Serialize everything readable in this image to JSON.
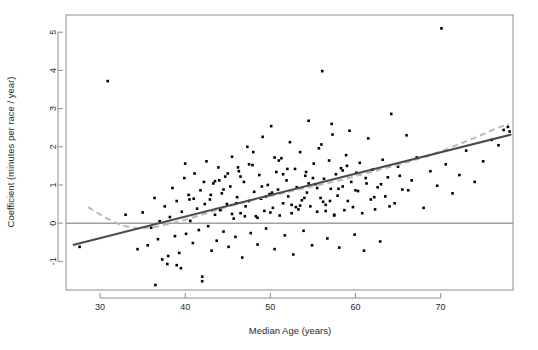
{
  "chart_data": {
    "type": "scatter",
    "title": "",
    "xlabel": "Median Age (years)",
    "ylabel": "Coefficient (minutes per race / year)",
    "xlim": [
      26.0,
      78.5
    ],
    "ylim": [
      -1.75,
      5.45
    ],
    "xticks": [
      30,
      40,
      50,
      60,
      70
    ],
    "xtick_labels": [
      "30",
      "40",
      "50",
      "60",
      "70"
    ],
    "yticks": [
      -1,
      0,
      1,
      2,
      3,
      4,
      5
    ],
    "ytick_labels": [
      "-1",
      "0",
      "1",
      "2",
      "3",
      "4",
      "5"
    ],
    "grid": false,
    "legend": "none",
    "point_color": "#000000",
    "point_marker": "filled-square",
    "point_size": 2.6,
    "series": [
      {
        "name": "races",
        "x": [
          27.6,
          30.9,
          33.0,
          34.4,
          35.0,
          35.6,
          36.0,
          36.4,
          36.8,
          37.0,
          37.3,
          37.6,
          37.9,
          38.2,
          38.5,
          38.8,
          39.0,
          39.3,
          39.6,
          39.9,
          40.1,
          40.4,
          40.6,
          40.9,
          41.1,
          41.4,
          41.6,
          41.8,
          42.0,
          42.3,
          42.5,
          42.7,
          42.9,
          43.1,
          43.3,
          43.5,
          43.7,
          43.9,
          44.1,
          44.3,
          44.5,
          44.7,
          44.9,
          45.1,
          45.3,
          45.5,
          45.7,
          45.9,
          46.1,
          46.3,
          46.5,
          46.7,
          46.9,
          47.1,
          47.3,
          47.5,
          47.7,
          47.9,
          48.1,
          48.3,
          48.5,
          48.7,
          48.9,
          49.1,
          49.3,
          49.5,
          49.7,
          49.9,
          50.1,
          50.3,
          50.5,
          50.7,
          50.9,
          51.1,
          51.3,
          51.5,
          51.7,
          51.9,
          52.1,
          52.3,
          52.5,
          52.7,
          52.9,
          53.1,
          53.3,
          53.5,
          53.7,
          53.9,
          54.1,
          54.3,
          54.5,
          54.7,
          54.9,
          55.1,
          55.3,
          55.5,
          55.7,
          55.9,
          56.1,
          56.3,
          56.5,
          56.7,
          56.9,
          57.1,
          57.3,
          57.5,
          57.7,
          57.9,
          58.1,
          58.3,
          58.5,
          58.7,
          58.9,
          59.1,
          59.3,
          59.5,
          59.7,
          59.9,
          60.1,
          60.3,
          60.5,
          60.8,
          61.0,
          61.3,
          61.5,
          61.8,
          62.0,
          62.3,
          62.6,
          62.9,
          63.2,
          63.5,
          63.8,
          64.2,
          64.6,
          65.0,
          65.5,
          66.0,
          66.6,
          67.2,
          68.0,
          68.8,
          69.6,
          70.1,
          70.6,
          71.4,
          72.2,
          73.0,
          74.0,
          75.0,
          76.0,
          76.8,
          77.4,
          77.9,
          78.1,
          44.0,
          46.0,
          48.0,
          50.0,
          52.0,
          54.0,
          56.0,
          58.0,
          43.0,
          45.0,
          47.0,
          49.0,
          51.0,
          53.0,
          55.0,
          57.0,
          59.0,
          41.0,
          42.0,
          44.5,
          46.5,
          48.5,
          50.5,
          52.5,
          54.5,
          56.5,
          58.5,
          60.0,
          39.5,
          40.5,
          43.5,
          45.5,
          47.5,
          49.5,
          51.5,
          53.5,
          55.5,
          57.5,
          36.5,
          38.0,
          42.2,
          44.2,
          46.2,
          50.2,
          54.2,
          56.2,
          57.2,
          61.2,
          62.2,
          63.0,
          64.0,
          65.2,
          66.2,
          39.0,
          40.0
        ],
        "y": [
          -0.62,
          3.72,
          0.22,
          -0.68,
          0.28,
          -0.58,
          -0.12,
          0.66,
          -0.42,
          0.05,
          -0.95,
          0.44,
          -1.07,
          0.16,
          0.92,
          -0.34,
          0.58,
          -0.78,
          0.3,
          1.18,
          -0.28,
          0.74,
          0.06,
          -0.52,
          1.3,
          0.38,
          -0.18,
          0.86,
          -1.4,
          0.5,
          1.62,
          -0.08,
          0.62,
          -0.72,
          1.04,
          0.22,
          -0.46,
          1.46,
          0.34,
          0.78,
          -0.22,
          1.22,
          0.5,
          -0.62,
          0.96,
          1.74,
          0.12,
          -0.36,
          0.68,
          1.36,
          0.26,
          -0.9,
          1.08,
          0.44,
          2.0,
          0.58,
          -0.26,
          1.52,
          0.82,
          0.18,
          -0.56,
          1.26,
          0.64,
          2.26,
          0.32,
          -0.14,
          1.0,
          0.76,
          2.54,
          0.4,
          -0.68,
          1.34,
          0.88,
          0.2,
          1.7,
          0.52,
          -0.32,
          1.12,
          0.7,
          2.12,
          0.26,
          -0.82,
          1.42,
          0.94,
          0.36,
          1.86,
          0.6,
          -0.2,
          1.24,
          0.8,
          2.68,
          0.44,
          -0.58,
          1.56,
          1.02,
          0.3,
          1.96,
          0.66,
          3.98,
          1.16,
          0.48,
          -0.4,
          1.64,
          0.9,
          2.32,
          0.22,
          1.28,
          0.72,
          -0.64,
          1.44,
          0.96,
          0.34,
          1.78,
          0.58,
          2.42,
          1.08,
          0.42,
          -0.3,
          1.32,
          0.84,
          1.58,
          0.26,
          -0.72,
          1.04,
          2.22,
          0.62,
          1.4,
          0.36,
          0.94,
          -0.48,
          1.66,
          0.7,
          1.2,
          2.86,
          0.52,
          1.48,
          0.88,
          2.3,
          1.12,
          1.72,
          0.4,
          1.36,
          0.98,
          5.1,
          1.54,
          0.78,
          1.26,
          1.9,
          1.08,
          1.62,
          2.18,
          2.04,
          2.44,
          2.52,
          2.4,
          1.12,
          0.52,
          1.86,
          0.28,
          1.42,
          0.66,
          2.06,
          0.9,
          0.74,
          1.3,
          0.18,
          0.96,
          1.64,
          0.42,
          1.18,
          0.58,
          1.5,
          0.64,
          -1.52,
          0.88,
          1.22,
          0.14,
          1.72,
          0.48,
          1.04,
          0.32,
          1.38,
          0.86,
          -1.18,
          0.62,
          1.1,
          0.24,
          1.54,
          0.7,
          1.28,
          0.46,
          0.92,
          0.2,
          -1.62,
          -0.86,
          1.08,
          0.36,
          1.46,
          0.8,
          1.34,
          0.56,
          2.6,
          1.18,
          0.68,
          1.02,
          0.44,
          1.24,
          0.86,
          -1.1,
          1.56
        ]
      }
    ],
    "fit_line": {
      "name": "linear-fit",
      "color": "#4a4a4a",
      "style": "solid",
      "x": [
        26.8,
        78.3
      ],
      "y": [
        -0.57,
        2.32
      ]
    },
    "smooth_line": {
      "name": "loess-smoother",
      "color": "#b9b9b9",
      "style": "dashed",
      "x": [
        28.6,
        30.5,
        32.5,
        34.5,
        36.5,
        38.5,
        40.5,
        42.5,
        44.5,
        46.5,
        48.5,
        50.5,
        52.5,
        54.5,
        56.5,
        58.5,
        60.5,
        62.5,
        64.5,
        66.5,
        68.5,
        70.5,
        72.5,
        74.5,
        76.5,
        78.0
      ],
      "y": [
        0.42,
        0.16,
        -0.06,
        -0.14,
        -0.1,
        0.0,
        0.12,
        0.26,
        0.4,
        0.52,
        0.64,
        0.74,
        0.84,
        0.94,
        1.04,
        1.14,
        1.26,
        1.38,
        1.5,
        1.62,
        1.76,
        1.92,
        2.1,
        2.28,
        2.48,
        2.6
      ]
    },
    "reference_line": {
      "name": "zero-line",
      "color": "#6f6f6f",
      "style": "solid",
      "y": 0
    }
  }
}
